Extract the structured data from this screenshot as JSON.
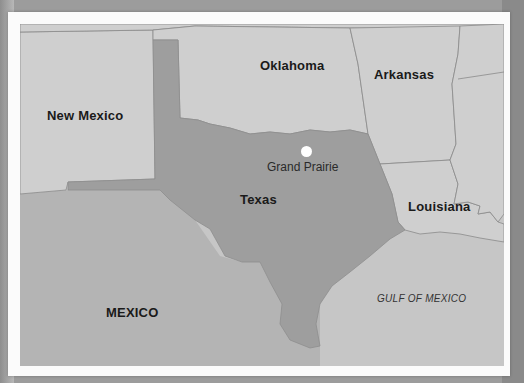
{
  "map": {
    "title": "Texas",
    "colors": {
      "background": "#9c9c9c",
      "frame": "#fbfbfb",
      "texas": "#9e9e9e",
      "neighbor_states": "#cfcfcf",
      "mexico": "#b4b4b4",
      "gulf": "#c6c6c6",
      "borders": "#8a8a8a",
      "city_marker": "#ffffff"
    },
    "highlight_region": "Texas",
    "regions": [
      {
        "id": "new-mexico",
        "label": "New Mexico"
      },
      {
        "id": "oklahoma",
        "label": "Oklahoma"
      },
      {
        "id": "arkansas",
        "label": "Arkansas"
      },
      {
        "id": "texas",
        "label": "Texas"
      },
      {
        "id": "louisiana",
        "label": "Louisiana"
      },
      {
        "id": "mexico",
        "label": "MEXICO"
      }
    ],
    "water_bodies": [
      {
        "id": "gulf-of-mexico",
        "label": "GULF OF MEXICO"
      }
    ],
    "cities": [
      {
        "id": "grand-prairie",
        "label": "Grand Prairie",
        "marker": "white-dot"
      }
    ]
  }
}
